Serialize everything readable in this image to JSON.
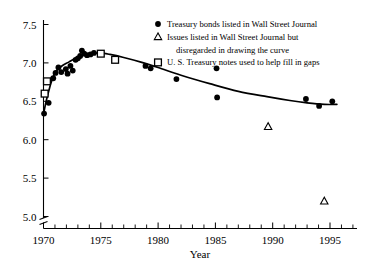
{
  "chart_data": {
    "type": "scatter",
    "title": "",
    "xlabel": "Year",
    "ylabel": "",
    "xlim": [
      1969.3,
      1998.5
    ],
    "ylim": [
      4.95,
      7.62
    ],
    "grid": false,
    "y_axis_break": true,
    "x_ticks_major": [
      1970,
      1975,
      1980,
      1985,
      1990,
      1995
    ],
    "x_tick_labels": [
      "1970",
      "1975",
      "1980",
      "1985",
      "1990",
      "1995"
    ],
    "x_tick_minor_step": 1,
    "y_ticks": [
      5.0,
      5.5,
      6.0,
      6.5,
      7.0,
      7.5
    ],
    "y_tick_labels": [
      "5.0",
      "5.5",
      "6.0",
      "6.5",
      "7.0",
      "7.5"
    ],
    "legend_position": "top-right",
    "legend": [
      {
        "marker": "dot",
        "label": "Treasury bonds listed in Wall Street Journal"
      },
      {
        "marker": "triangle",
        "label": "Issues listed in Wall Street Journal but",
        "label2": "disregarded in drawing the curve"
      },
      {
        "marker": "square",
        "label": "U. S. Treasury notes used to help fill in gaps"
      }
    ],
    "series": [
      {
        "name": "Treasury bonds listed in Wall Street Journal",
        "marker": "dot",
        "points": [
          [
            1970.05,
            6.34
          ],
          [
            1970.45,
            6.48
          ],
          [
            1970.85,
            6.8
          ],
          [
            1971.05,
            6.87
          ],
          [
            1971.3,
            6.94
          ],
          [
            1971.55,
            6.88
          ],
          [
            1971.95,
            6.92
          ],
          [
            1972.1,
            6.86
          ],
          [
            1972.35,
            6.96
          ],
          [
            1972.55,
            6.9
          ],
          [
            1972.8,
            7.04
          ],
          [
            1973.0,
            7.06
          ],
          [
            1973.2,
            7.09
          ],
          [
            1973.35,
            7.16
          ],
          [
            1973.55,
            7.12
          ],
          [
            1973.8,
            7.1
          ],
          [
            1974.1,
            7.11
          ],
          [
            1974.4,
            7.13
          ],
          [
            1978.9,
            6.96
          ],
          [
            1979.35,
            6.93
          ],
          [
            1981.6,
            6.79
          ],
          [
            1985.1,
            6.93
          ],
          [
            1985.15,
            6.55
          ],
          [
            1992.9,
            6.53
          ],
          [
            1994.05,
            6.44
          ],
          [
            1995.2,
            6.5
          ]
        ]
      },
      {
        "name": "Issues listed in Wall Street Journal but disregarded in drawing the curve",
        "marker": "triangle",
        "points": [
          [
            1989.6,
            6.17
          ],
          [
            1994.5,
            5.2
          ]
        ]
      },
      {
        "name": "U. S. Treasury notes used to help fill in gaps",
        "marker": "square",
        "points": [
          [
            1970.1,
            6.6
          ],
          [
            1970.3,
            6.76
          ],
          [
            1975.0,
            7.12
          ],
          [
            1976.25,
            7.04
          ]
        ]
      }
    ],
    "curve": [
      [
        1970.0,
        6.33
      ],
      [
        1970.2,
        6.48
      ],
      [
        1970.45,
        6.63
      ],
      [
        1970.75,
        6.78
      ],
      [
        1971.1,
        6.89
      ],
      [
        1971.6,
        6.96
      ],
      [
        1972.2,
        7.01
      ],
      [
        1972.8,
        7.06
      ],
      [
        1973.4,
        7.1
      ],
      [
        1974.1,
        7.12
      ],
      [
        1974.9,
        7.13
      ],
      [
        1975.8,
        7.11
      ],
      [
        1977.0,
        7.07
      ],
      [
        1978.5,
        7.01
      ],
      [
        1980.0,
        6.94
      ],
      [
        1982.0,
        6.84
      ],
      [
        1984.5,
        6.73
      ],
      [
        1987.0,
        6.63
      ],
      [
        1989.5,
        6.56
      ],
      [
        1991.5,
        6.51
      ],
      [
        1993.0,
        6.48
      ],
      [
        1994.5,
        6.46
      ],
      [
        1995.6,
        6.46
      ]
    ]
  }
}
